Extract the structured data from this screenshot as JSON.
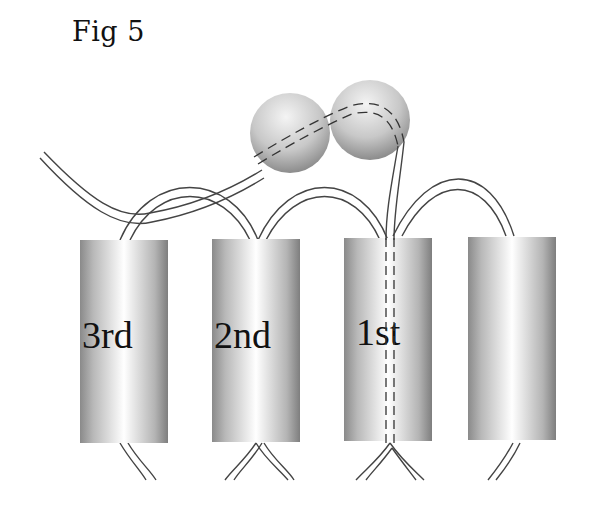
{
  "figure": {
    "title": "Fig 5",
    "helices": [
      {
        "label": "3rd"
      },
      {
        "label": "2nd"
      },
      {
        "label": "1st"
      },
      {
        "label": ""
      }
    ]
  }
}
